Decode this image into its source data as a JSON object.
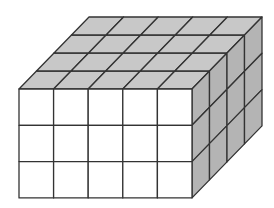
{
  "diagram": {
    "dimensions": {
      "width_cubes": 5,
      "height_cubes": 3,
      "depth_cubes": 4
    },
    "colors": {
      "front_face": "#ffffff",
      "top_face": "#c8c8c8",
      "right_face": "#b4b4b4",
      "edge": "#333333",
      "background": "#ffffff"
    },
    "geometry": {
      "front_x": 19,
      "front_y": 89,
      "cell_w": 34.6,
      "cell_h": 36.3,
      "depth_dx": 17.5,
      "depth_dy": -18
    }
  }
}
